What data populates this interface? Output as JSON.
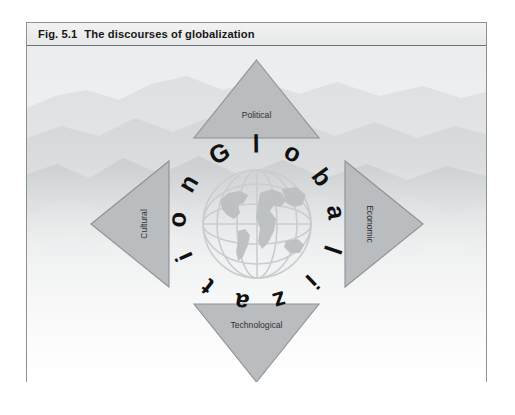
{
  "figure": {
    "number": "Fig. 5.1",
    "caption": "The discourses of globalization"
  },
  "center": {
    "word": "Globalization",
    "icon": "globe-icon"
  },
  "discourses": [
    {
      "label": "Political",
      "position": "top",
      "direction": "up"
    },
    {
      "label": "Economic",
      "position": "right",
      "direction": "right"
    },
    {
      "label": "Technological",
      "position": "bottom",
      "direction": "down"
    },
    {
      "label": "Cultural",
      "position": "left",
      "direction": "left"
    }
  ],
  "colors": {
    "triangle_fill": "#b9bdbf",
    "triangle_stroke": "#8e9295",
    "label_text": "#2f3133",
    "caption_text": "#171717",
    "caption_bar": "#e9eaea",
    "frame_border": "#8d9093",
    "globe_line": "#c9cdd0",
    "globe_land": "#b6babd",
    "ring_text": "#101010",
    "background": "#ffffff"
  },
  "background": {
    "description": "misty-mountain-landscape"
  }
}
